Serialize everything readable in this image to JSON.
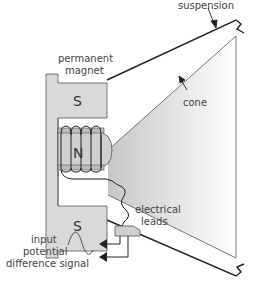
{
  "diagram": {
    "labels": {
      "suspension": "suspension",
      "permanent_magnet_line1": "permanent",
      "permanent_magnet_line2": "magnet",
      "cone": "cone",
      "electrical_leads_line1": "electrical",
      "electrical_leads_line2": "leads",
      "input_line1": "input",
      "input_line2": "potential",
      "input_line3": "difference signal"
    },
    "poles": {
      "top_south": "S",
      "center_north": "N",
      "bottom_south": "S"
    },
    "colors": {
      "magnet_fill": "#d9d9d9",
      "cone_gradient_start": "#c8c8c8",
      "cone_gradient_end": "#ffffff",
      "stroke": "#333333",
      "text": "#444444"
    }
  }
}
